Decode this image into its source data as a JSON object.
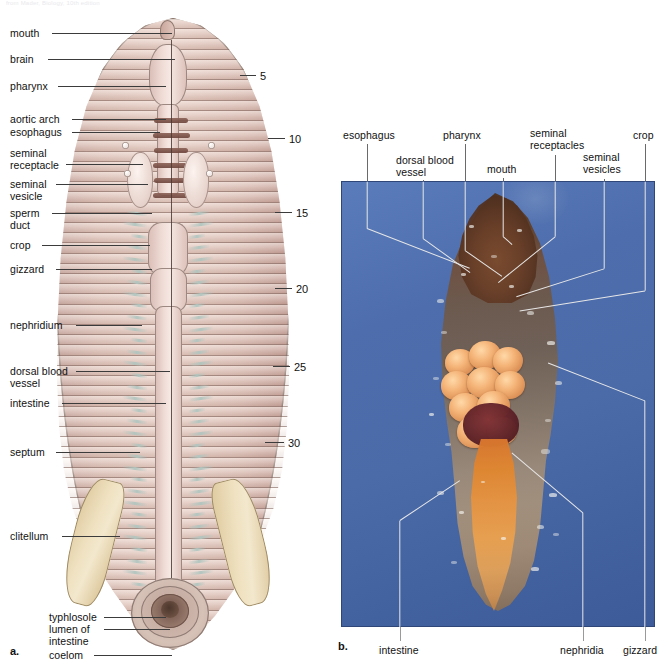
{
  "figure": {
    "faint_header": "from Mader, Biology, 10th edition",
    "panel_a_letter": "a.",
    "panel_b_letter": "b."
  },
  "panel_a": {
    "title": "Earthworm internal anatomy, dorsal dissection (drawing)",
    "labels_left": [
      {
        "id": "mouth",
        "text": "mouth",
        "x": 10,
        "y": 28,
        "lead_y": 33,
        "lead_x1": 52,
        "lead_x2": 172
      },
      {
        "id": "brain",
        "text": "brain",
        "x": 10,
        "y": 54,
        "lead_y": 59,
        "lead_x1": 48,
        "lead_x2": 175
      },
      {
        "id": "pharynx",
        "text": "pharynx",
        "x": 10,
        "y": 81,
        "lead_y": 86,
        "lead_x1": 58,
        "lead_x2": 166
      },
      {
        "id": "aortic-arch",
        "text": "aortic arch",
        "x": 10,
        "y": 114,
        "lead_y": 119,
        "lead_x1": 72,
        "lead_x2": 166
      },
      {
        "id": "esophagus",
        "text": "esophagus",
        "x": 10,
        "y": 127,
        "lead_y": 132,
        "lead_x1": 72,
        "lead_x2": 160
      },
      {
        "id": "seminal-receptacle",
        "text": "seminal\nreceptacle",
        "x": 10,
        "y": 148,
        "lead_y": 164,
        "lead_x1": 66,
        "lead_x2": 143
      },
      {
        "id": "seminal-vesicle",
        "text": "seminal\nvesicle",
        "x": 10,
        "y": 179,
        "lead_y": 184,
        "lead_x1": 56,
        "lead_x2": 148
      },
      {
        "id": "sperm-duct",
        "text": "sperm\nduct",
        "x": 10,
        "y": 208,
        "lead_y": 213,
        "lead_x1": 52,
        "lead_x2": 152
      },
      {
        "id": "crop",
        "text": "crop",
        "x": 10,
        "y": 240,
        "lead_y": 245,
        "lead_x1": 42,
        "lead_x2": 150
      },
      {
        "id": "gizzard",
        "text": "gizzard",
        "x": 10,
        "y": 264,
        "lead_y": 269,
        "lead_x1": 56,
        "lead_x2": 152
      },
      {
        "id": "nephridium",
        "text": "nephridium",
        "x": 10,
        "y": 320,
        "lead_y": 325,
        "lead_x1": 76,
        "lead_x2": 142
      },
      {
        "id": "dorsal-blood-vessel",
        "text": "dorsal blood\nvessel",
        "x": 10,
        "y": 366,
        "lead_y": 371,
        "lead_x1": 76,
        "lead_x2": 170
      },
      {
        "id": "intestine",
        "text": "intestine",
        "x": 10,
        "y": 398,
        "lead_y": 403,
        "lead_x1": 62,
        "lead_x2": 166
      },
      {
        "id": "septum",
        "text": "septum",
        "x": 10,
        "y": 447,
        "lead_y": 452,
        "lead_x1": 56,
        "lead_x2": 140
      },
      {
        "id": "clitellum",
        "text": "clitellum",
        "x": 10,
        "y": 531,
        "lead_y": 536,
        "lead_x1": 62,
        "lead_x2": 120
      },
      {
        "id": "typhlosole",
        "text": "typhlosole",
        "x": 49,
        "y": 612,
        "lead_y": 617,
        "lead_x1": 104,
        "lead_x2": 166
      },
      {
        "id": "lumen-of-intestine",
        "text": "lumen of\nintestine",
        "x": 49,
        "y": 624,
        "lead_y": 629,
        "lead_x1": 104,
        "lead_x2": 170
      },
      {
        "id": "coelom",
        "text": "coelom",
        "x": 49,
        "y": 650,
        "lead_y": 655,
        "lead_x1": 94,
        "lead_x2": 172
      }
    ],
    "segment_numbers": [
      {
        "value": "5",
        "x": 260,
        "y": 70,
        "tick_x1": 240,
        "tick_x2": 256,
        "tick_y": 75
      },
      {
        "value": "10",
        "x": 289,
        "y": 133,
        "tick_x1": 268,
        "tick_x2": 285,
        "tick_y": 138
      },
      {
        "value": "15",
        "x": 296,
        "y": 207,
        "tick_x1": 275,
        "tick_x2": 292,
        "tick_y": 212
      },
      {
        "value": "20",
        "x": 296,
        "y": 283,
        "tick_x1": 275,
        "tick_x2": 292,
        "tick_y": 288
      },
      {
        "value": "25",
        "x": 294,
        "y": 361,
        "tick_x1": 273,
        "tick_x2": 290,
        "tick_y": 366
      },
      {
        "value": "30",
        "x": 288,
        "y": 437,
        "tick_x1": 265,
        "tick_x2": 284,
        "tick_y": 442
      }
    ]
  },
  "panel_b": {
    "title": "Earthworm internal anatomy, preserved specimen (photograph)",
    "background_color": "#4a6aa8",
    "labels_top": [
      {
        "id": "esophagus",
        "text": "esophagus",
        "x": 343,
        "y": 130,
        "lead_x": 367,
        "lead_y1": 144,
        "lead_y2": 181
      },
      {
        "id": "dorsal-blood-vessel",
        "text": "dorsal blood\nvessel",
        "x": 396,
        "y": 155,
        "lead_x": 423,
        "lead_y1": 180,
        "lead_y2": 181
      },
      {
        "id": "pharynx",
        "text": "pharynx",
        "x": 443,
        "y": 130,
        "lead_x": 465,
        "lead_y1": 144,
        "lead_y2": 181
      },
      {
        "id": "mouth",
        "text": "mouth",
        "x": 487,
        "y": 164,
        "lead_x": 503,
        "lead_y1": 178,
        "lead_y2": 181
      },
      {
        "id": "seminal-receptacles",
        "text": "seminal\nreceptacles",
        "x": 530,
        "y": 128,
        "lead_x": 555,
        "lead_y1": 155,
        "lead_y2": 181
      },
      {
        "id": "seminal-vesicles",
        "text": "seminal\nvesicles",
        "x": 583,
        "y": 152,
        "lead_x": 604,
        "lead_y1": 179,
        "lead_y2": 181
      },
      {
        "id": "crop",
        "text": "crop",
        "x": 633,
        "y": 130,
        "lead_x": 645,
        "lead_y1": 144,
        "lead_y2": 181
      }
    ],
    "labels_bottom": [
      {
        "id": "intestine",
        "text": "intestine",
        "x": 379,
        "y": 645,
        "lead_x": 400,
        "lead_y1": 627,
        "lead_y2": 641
      },
      {
        "id": "nephridia",
        "text": "nephridia",
        "x": 560,
        "y": 645,
        "lead_x": 583,
        "lead_y1": 627,
        "lead_y2": 641
      },
      {
        "id": "gizzard",
        "text": "gizzard",
        "x": 623,
        "y": 645,
        "lead_x": 645,
        "lead_y1": 627,
        "lead_y2": 641
      }
    ]
  }
}
